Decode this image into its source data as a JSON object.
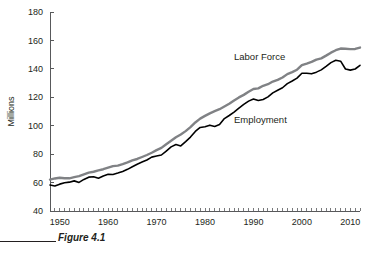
{
  "figure": {
    "caption": "Figure 4.1",
    "rule_color": "#231f20"
  },
  "chart_data": {
    "type": "line",
    "title": "",
    "xlabel": "",
    "ylabel": "Millions",
    "xlim": [
      1948,
      2012
    ],
    "ylim": [
      40,
      180
    ],
    "ytick_labels": [
      "40",
      "60",
      "80",
      "100",
      "120",
      "140",
      "160",
      "180"
    ],
    "yticks": [
      40,
      60,
      80,
      100,
      120,
      140,
      160,
      180
    ],
    "xtick_labels": [
      "1950",
      "1960",
      "1970",
      "1980",
      "1990",
      "2000",
      "2010"
    ],
    "xticks": [
      1950,
      1960,
      1970,
      1980,
      1990,
      2000,
      2010
    ],
    "minor_xtick_interval": 1,
    "grid": false,
    "legend_position": "inline-annotation",
    "x": [
      1948,
      1949,
      1950,
      1951,
      1952,
      1953,
      1954,
      1955,
      1956,
      1957,
      1958,
      1959,
      1960,
      1961,
      1962,
      1963,
      1964,
      1965,
      1966,
      1967,
      1968,
      1969,
      1970,
      1971,
      1972,
      1973,
      1974,
      1975,
      1976,
      1977,
      1978,
      1979,
      1980,
      1981,
      1982,
      1983,
      1984,
      1985,
      1986,
      1987,
      1988,
      1989,
      1990,
      1991,
      1992,
      1993,
      1994,
      1995,
      1996,
      1997,
      1998,
      1999,
      2000,
      2001,
      2002,
      2003,
      2004,
      2005,
      2006,
      2007,
      2008,
      2009,
      2010,
      2011,
      2012
    ],
    "series": [
      {
        "name": "Labor Force",
        "color": "#808285",
        "label_text": "Labor Force",
        "values": [
          62.1,
          62.9,
          63.4,
          63.0,
          63.0,
          63.8,
          64.5,
          65.8,
          67.0,
          67.6,
          68.6,
          69.4,
          70.5,
          71.6,
          71.9,
          73.0,
          74.2,
          75.6,
          76.6,
          78.0,
          79.4,
          81.0,
          82.8,
          84.4,
          87.0,
          89.4,
          91.9,
          93.8,
          96.2,
          99.0,
          102.3,
          105.0,
          106.9,
          108.7,
          110.2,
          111.6,
          113.5,
          115.5,
          117.8,
          119.9,
          121.7,
          123.9,
          125.8,
          126.3,
          128.1,
          129.2,
          131.1,
          132.3,
          133.9,
          136.3,
          137.7,
          139.4,
          142.6,
          143.7,
          144.9,
          146.5,
          147.4,
          149.3,
          151.4,
          153.1,
          154.3,
          154.1,
          153.9,
          154.0,
          155.0
        ]
      },
      {
        "name": "Employment",
        "color": "#000000",
        "label_text": "Employment",
        "values": [
          58.3,
          57.6,
          58.9,
          59.9,
          60.3,
          61.2,
          60.1,
          62.2,
          63.8,
          64.1,
          63.0,
          64.6,
          65.8,
          65.7,
          66.7,
          67.8,
          69.3,
          71.1,
          72.9,
          74.4,
          75.9,
          77.9,
          78.7,
          79.4,
          82.2,
          85.1,
          86.8,
          85.8,
          88.8,
          92.0,
          96.0,
          98.8,
          99.3,
          100.4,
          99.5,
          100.8,
          105.0,
          107.2,
          109.6,
          112.4,
          115.0,
          117.3,
          118.8,
          117.7,
          118.5,
          120.3,
          123.1,
          124.9,
          126.7,
          129.6,
          131.5,
          133.5,
          136.9,
          136.9,
          136.5,
          137.7,
          139.3,
          141.7,
          144.4,
          146.0,
          145.4,
          139.9,
          139.1,
          139.9,
          142.5
        ]
      }
    ]
  }
}
